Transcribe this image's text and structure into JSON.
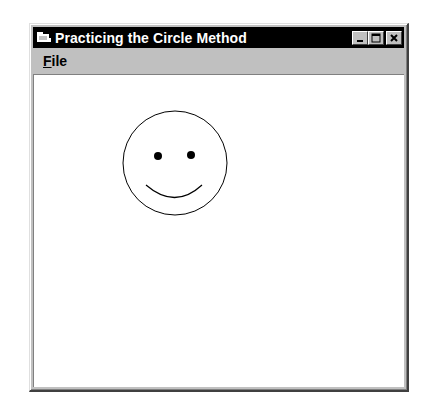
{
  "window": {
    "title": "Practicing the Circle Method",
    "icons": {
      "app": "form-icon",
      "minimize": "minimize-icon",
      "maximize": "maximize-icon",
      "close": "close-icon"
    }
  },
  "menubar": {
    "items": [
      {
        "label": "File",
        "mnemonic": "F",
        "rest": "ile"
      }
    ]
  },
  "drawing": {
    "face": {
      "cx": 141,
      "cy": 88,
      "r": 52,
      "stroke": "#000000"
    },
    "eyes": [
      {
        "cx": 124,
        "cy": 81,
        "r": 4
      },
      {
        "cx": 157,
        "cy": 80,
        "r": 4
      }
    ],
    "smile": {
      "path": "M112 110 Q141 135 168 110"
    }
  }
}
